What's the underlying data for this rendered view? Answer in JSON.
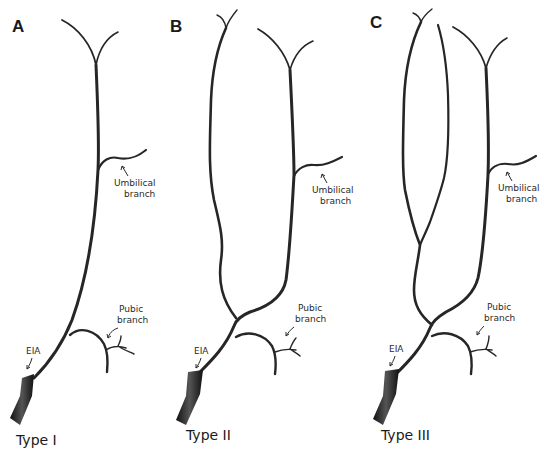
{
  "figure": {
    "panels": [
      {
        "letter": "A",
        "type_label": "Type I",
        "labels": {
          "eia": "EIA",
          "pubic_1": "Pubic",
          "pubic_2": "branch",
          "umbilical_1": "Umbilical",
          "umbilical_2": "branch"
        }
      },
      {
        "letter": "B",
        "type_label": "Type II",
        "labels": {
          "eia": "EIA",
          "pubic_1": "Pubic",
          "pubic_2": "branch",
          "umbilical_1": "Umbilical",
          "umbilical_2": "branch"
        }
      },
      {
        "letter": "C",
        "type_label": "Type III",
        "labels": {
          "eia": "EIA",
          "pubic_1": "Pubic",
          "pubic_2": "branch",
          "umbilical_1": "Umbilical",
          "umbilical_2": "branch"
        }
      }
    ],
    "colors": {
      "vessel": "#262626",
      "text": "#1a1a1a",
      "background": "#ffffff"
    }
  }
}
